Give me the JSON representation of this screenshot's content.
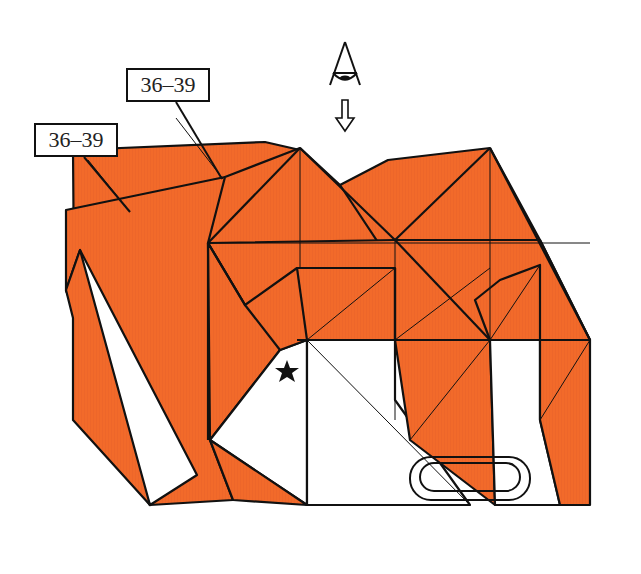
{
  "diagram": {
    "type": "origami-folding-step",
    "paper_color": "#f26a2a",
    "line_color": "#111111",
    "background": "#ffffff",
    "labels": [
      {
        "id": "label-upper",
        "text": "36–39",
        "x": 126,
        "y": 68,
        "w": 84,
        "h": 34
      },
      {
        "id": "label-left",
        "text": "36–39",
        "x": 34,
        "y": 123,
        "w": 84,
        "h": 34
      }
    ],
    "symbols": {
      "view_eye": {
        "name": "view-from-above-eye-icon",
        "x": 345,
        "y": 80
      },
      "view_arrow": {
        "name": "down-hollow-arrow-icon",
        "x": 345,
        "y": 125
      },
      "star": {
        "name": "star-reference-mark-icon",
        "x": 287,
        "y": 372
      },
      "clip": {
        "name": "paperclip-hold-icon",
        "x": 455,
        "y": 480
      }
    }
  }
}
